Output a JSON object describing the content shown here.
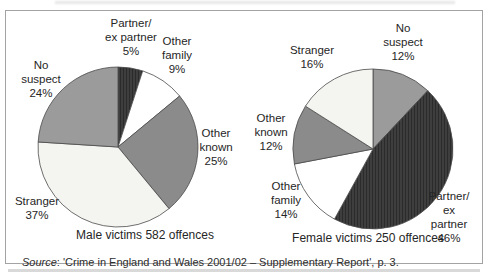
{
  "figure": {
    "source": {
      "prefix": "Source",
      "text": ": 'Crime in England and Wales 2001/02 – Supplementary Report', p. 3."
    }
  },
  "chart_data": [
    {
      "type": "pie",
      "title": "Male victims 582 offences",
      "group": "Male victims",
      "offences": 582,
      "start_angle": "12 o'clock, clockwise",
      "slices": [
        {
          "name": "Partner/ex partner",
          "value": 5,
          "label": "Partner/\nex partner\n5%",
          "color": "#3e3e3e",
          "hatch": true
        },
        {
          "name": "Other family",
          "value": 9,
          "label": "Other\nfamily\n9%",
          "color": "#ffffff"
        },
        {
          "name": "Other known",
          "value": 25,
          "label": "Other\nknown\n25%",
          "color": "#8b8b8b"
        },
        {
          "name": "Stranger",
          "value": 37,
          "label": "Stranger\n37%",
          "color": "#f4f4f0"
        },
        {
          "name": "No suspect",
          "value": 24,
          "label": "No\nsuspect\n24%",
          "color": "#9b9b9b"
        }
      ]
    },
    {
      "type": "pie",
      "title": "Female victims 250 offences",
      "group": "Female victims",
      "offences": 250,
      "start_angle": "12 o'clock, clockwise",
      "slices": [
        {
          "name": "No suspect",
          "value": 12,
          "label": "No\nsuspect\n12%",
          "color": "#9b9b9b"
        },
        {
          "name": "Partner/ex partner",
          "value": 46,
          "label": "Partner/\nex partner\n46%",
          "color": "#3e3e3e",
          "hatch": true
        },
        {
          "name": "Other family",
          "value": 14,
          "label": "Other\nfamily\n14%",
          "color": "#ffffff"
        },
        {
          "name": "Other known",
          "value": 12,
          "label": "Other\nknown\n12%",
          "color": "#8b8b8b"
        },
        {
          "name": "Stranger",
          "value": 16,
          "label": "Stranger\n16%",
          "color": "#f4f4f0"
        }
      ]
    }
  ]
}
